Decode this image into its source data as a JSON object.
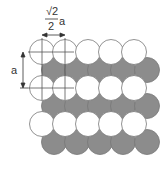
{
  "diagram": {
    "labels": {
      "width_numerator": "√2",
      "width_denominator": "2",
      "width_variable": "a",
      "height_label": "a"
    },
    "colors": {
      "white_circle_fill": "#ffffff",
      "grey_circle_fill": "#8c8c8c",
      "stroke": "#777777",
      "annotation": "#333333"
    },
    "circle_radius": 12.5,
    "rows": [
      {
        "type": "white",
        "y": 52,
        "x": [
          42,
          65,
          88,
          111,
          134
        ]
      },
      {
        "type": "grey",
        "y": 70,
        "x": [
          54,
          77,
          100,
          123,
          147
        ]
      },
      {
        "type": "white",
        "y": 88,
        "x": [
          42,
          65,
          88,
          111,
          134
        ]
      },
      {
        "type": "grey",
        "y": 106,
        "x": [
          54,
          77,
          100,
          123,
          147
        ]
      },
      {
        "type": "white",
        "y": 124,
        "x": [
          42,
          65,
          88,
          111,
          134
        ]
      },
      {
        "type": "grey",
        "y": 142,
        "x": [
          54,
          77,
          100,
          123,
          147
        ]
      }
    ]
  }
}
